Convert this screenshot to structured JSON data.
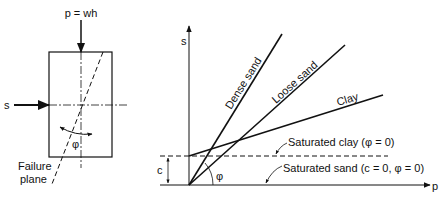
{
  "element_diagram": {
    "load_label": "p = wh",
    "shear_label": "s",
    "angle_label": "φ",
    "failure_plane_line1": "Failure",
    "failure_plane_line2": "plane"
  },
  "graph": {
    "y_axis_label": "s",
    "x_axis_label": "p",
    "cohesion_label": "c",
    "angle_label": "φ",
    "lines": [
      {
        "label": "Dense sand"
      },
      {
        "label": "Loose sand"
      },
      {
        "label": "Clay"
      }
    ],
    "annotations": {
      "saturated_clay": "Saturated clay (φ = 0)",
      "saturated_sand": "Saturated sand (c = 0, φ = 0)"
    }
  },
  "colors": {
    "ink": "#111111",
    "background": "#ffffff"
  }
}
